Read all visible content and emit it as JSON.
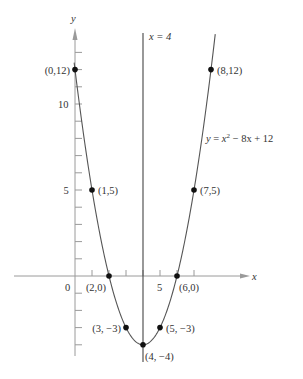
{
  "chart_data": {
    "type": "line",
    "title": "",
    "equation_label": "y = x² − 8x + 12",
    "equation_parts": {
      "lhs": "y",
      "eq": " = ",
      "x": "x",
      "sup": "2",
      "rest": " − 8x + 12"
    },
    "xlabel": "x",
    "ylabel": "y",
    "xlim": [
      -4,
      10
    ],
    "ylim": [
      -5,
      14
    ],
    "x_ticks": [
      1,
      2,
      3,
      4,
      5,
      6,
      7
    ],
    "x_tick_labels": [
      {
        "value": 5,
        "label": "5"
      }
    ],
    "y_ticks": [
      -4,
      -3,
      -2,
      -1,
      1,
      2,
      3,
      4,
      5,
      6,
      7,
      8,
      9,
      10,
      11,
      12,
      13
    ],
    "y_tick_labels": [
      {
        "value": 5,
        "label": "5"
      },
      {
        "value": 10,
        "label": "10"
      }
    ],
    "origin_label": "0",
    "grid": false,
    "series": [
      {
        "name": "y = x^2 - 8x + 12",
        "function": "x^2 - 8x + 12",
        "x_range": [
          -0.05,
          8.25
        ],
        "color": "#555555"
      }
    ],
    "axis_of_symmetry": {
      "x": 4,
      "label": "x = 4",
      "color": "#444444"
    },
    "points": [
      {
        "x": 0,
        "y": 12,
        "label": "(0,12)",
        "label_side": "left"
      },
      {
        "x": 1,
        "y": 5,
        "label": "(1,5)",
        "label_side": "right"
      },
      {
        "x": 2,
        "y": 0,
        "label": "(2,0)",
        "label_side": "below-left"
      },
      {
        "x": 3,
        "y": -3,
        "label": "(3, −3)",
        "label_side": "left"
      },
      {
        "x": 4,
        "y": -4,
        "label": "(4, −4)",
        "label_side": "below-right"
      },
      {
        "x": 5,
        "y": -3,
        "label": "(5, −3)",
        "label_side": "right"
      },
      {
        "x": 6,
        "y": 0,
        "label": "(6,0)",
        "label_side": "below-right"
      },
      {
        "x": 7,
        "y": 5,
        "label": "(7,5)",
        "label_side": "right"
      },
      {
        "x": 8,
        "y": 12,
        "label": "(8,12)",
        "label_side": "right"
      }
    ],
    "colors": {
      "axis": "#9a9a9a",
      "curve": "#555555",
      "point": "#111111",
      "text": "#333333"
    }
  }
}
